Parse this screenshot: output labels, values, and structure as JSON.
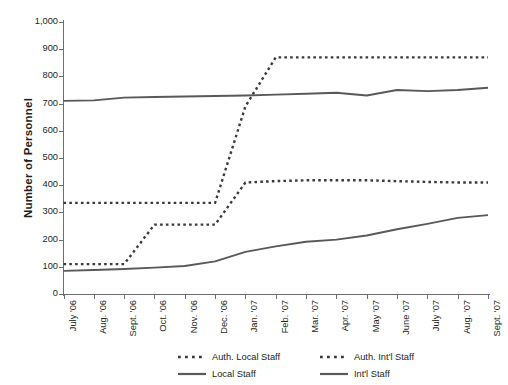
{
  "chart_data": {
    "type": "line",
    "title": "",
    "xlabel": "",
    "ylabel": "Number of Personnel",
    "ylim": [
      0,
      1000
    ],
    "ytick_step": 100,
    "grid": false,
    "legend_position": "bottom",
    "categories": [
      "July '06",
      "Aug. '06",
      "Sept. '06",
      "Oct. '06",
      "Nov. '06",
      "Dec. '06",
      "Jan. '07",
      "Feb. '07",
      "Mar. '07",
      "Apr. '07",
      "May '07",
      "June '07",
      "July '07",
      "Aug. '07",
      "Sept. '07"
    ],
    "ytick_labels": [
      "0",
      "100",
      "200",
      "300",
      "400",
      "500",
      "600",
      "700",
      "800",
      "900",
      "1,000"
    ],
    "ytick_values": [
      0,
      100,
      200,
      300,
      400,
      500,
      600,
      700,
      800,
      900,
      1000
    ],
    "series": [
      {
        "name": "Auth. Local Staff",
        "style": "dotted",
        "color": "#3b3b3b",
        "values": [
          110,
          110,
          110,
          255,
          255,
          255,
          410,
          415,
          418,
          418,
          418,
          415,
          412,
          410,
          410
        ]
      },
      {
        "name": "Auth. Int'l Staff",
        "style": "dotted",
        "color": "#3b3b3b",
        "values": [
          335,
          335,
          335,
          335,
          335,
          335,
          690,
          870,
          870,
          870,
          870,
          870,
          870,
          870,
          870
        ]
      },
      {
        "name": "Local Staff",
        "style": "solid",
        "color": "#58595b",
        "values": [
          85,
          88,
          92,
          97,
          103,
          120,
          155,
          175,
          192,
          200,
          215,
          238,
          258,
          280,
          290
        ]
      },
      {
        "name": "Int'l Staff",
        "style": "solid",
        "color": "#58595b",
        "values": [
          710,
          712,
          722,
          724,
          726,
          728,
          730,
          733,
          736,
          740,
          730,
          750,
          746,
          750,
          758
        ]
      }
    ]
  },
  "legend": {
    "items": [
      {
        "label": "Auth. Local Staff",
        "style": "dotted"
      },
      {
        "label": "Auth. Int'l  Staff",
        "style": "dotted"
      },
      {
        "label": "Local Staff",
        "style": "solid"
      },
      {
        "label": "Int'l Staff",
        "style": "solid"
      }
    ]
  }
}
